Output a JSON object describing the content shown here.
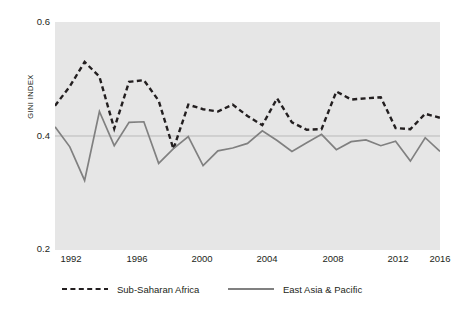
{
  "chart_data": {
    "type": "line",
    "title": "",
    "subtitle": "",
    "xlabel": "",
    "ylabel": "GINI INDEX",
    "xlim": [
      1991,
      2017
    ],
    "ylim": [
      0.2,
      0.6
    ],
    "grid": true,
    "gridlines_y": [
      0.4
    ],
    "legend_position": "bottom",
    "plot_background": "#e6e6e6",
    "x_ticks": [
      1992,
      1996,
      2000,
      2004,
      2008,
      2012,
      2016
    ],
    "y_ticks": [
      "0.6",
      "0.4",
      "0.2"
    ],
    "y_tick_values": [
      0.6,
      0.4,
      0.2
    ],
    "x": [
      1991,
      1992,
      1993,
      1994,
      1995,
      1996,
      1997,
      1998,
      1999,
      2000,
      2001,
      2002,
      2003,
      2004,
      2005,
      2006,
      2007,
      2008,
      2009,
      2010,
      2011,
      2012,
      2013,
      2014,
      2015,
      2016,
      2017
    ],
    "series": [
      {
        "name": "Sub-Saharan Africa",
        "style": "dashed",
        "color": "#231f20",
        "values": [
          0.453,
          0.487,
          0.53,
          0.504,
          0.413,
          0.495,
          0.498,
          0.462,
          0.377,
          0.455,
          0.447,
          0.443,
          0.455,
          0.435,
          0.419,
          0.466,
          0.424,
          0.411,
          0.412,
          0.478,
          0.464,
          0.466,
          0.468,
          0.414,
          0.412,
          0.439,
          0.432
        ]
      },
      {
        "name": "East Asia & Pacific",
        "style": "solid",
        "color": "#808080",
        "values": [
          0.416,
          0.381,
          0.322,
          0.443,
          0.383,
          0.424,
          0.425,
          0.352,
          0.378,
          0.399,
          0.348,
          0.374,
          0.379,
          0.387,
          0.409,
          0.392,
          0.373,
          0.388,
          0.403,
          0.376,
          0.39,
          0.393,
          0.383,
          0.391,
          0.356,
          0.397,
          0.373
        ]
      }
    ],
    "annotations": []
  },
  "legend": {
    "entries": [
      {
        "label": "Sub-Saharan Africa",
        "swatch": "dashed-line-swatch"
      },
      {
        "label": "East Asia & Pacific",
        "swatch": "solid-line-swatch"
      }
    ]
  },
  "axes": {
    "y_title": "GINI INDEX",
    "y_tick_0": "0.6",
    "y_tick_1": "0.4",
    "y_tick_2": "0.2",
    "x_tick_0": "1992",
    "x_tick_1": "1996",
    "x_tick_2": "2000",
    "x_tick_3": "2004",
    "x_tick_4": "2008",
    "x_tick_5": "2012",
    "x_tick_6": "2016"
  }
}
